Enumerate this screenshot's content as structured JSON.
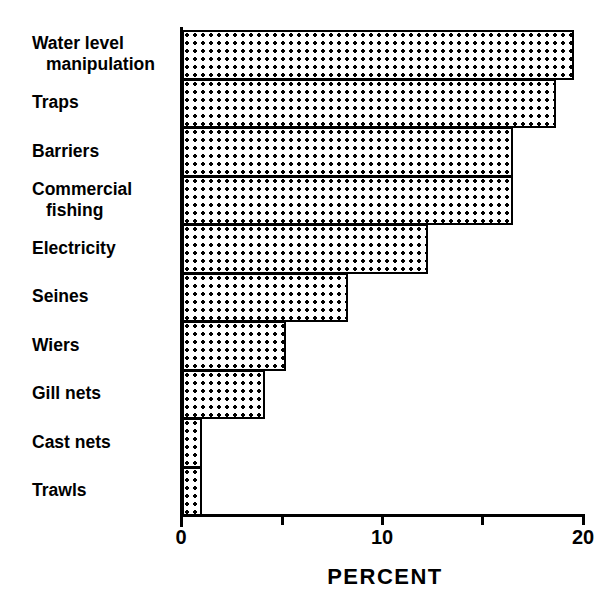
{
  "chart_data": {
    "type": "bar",
    "orientation": "horizontal",
    "title": "",
    "xlabel": "PERCENT",
    "ylabel": "",
    "xlim": [
      0,
      20
    ],
    "xticks": [
      0,
      5,
      10,
      15,
      20
    ],
    "xtick_labels": [
      "0",
      "",
      "10",
      "",
      "20"
    ],
    "grid": false,
    "legend": null,
    "categories": [
      "Water level manipulation",
      "Traps",
      "Barriers",
      "Commercial fishing",
      "Electricity",
      "Seines",
      "Wiers",
      "Gill nets",
      "Cast nets",
      "Trawls"
    ],
    "values": [
      19.3,
      18.4,
      16.3,
      16.3,
      12.1,
      8.2,
      5.1,
      4.1,
      1.0,
      1.0
    ],
    "bar_fill": "dotted-hatch",
    "bar_edge_color": "#000000",
    "bar_face_color": "#ffffff"
  },
  "labels": [
    {
      "line1": "Water level",
      "line2": "manipulation"
    },
    {
      "line1": "Traps",
      "line2": ""
    },
    {
      "line1": "Barriers",
      "line2": ""
    },
    {
      "line1": "Commercial",
      "line2": "fishing"
    },
    {
      "line1": "Electricity",
      "line2": ""
    },
    {
      "line1": "Seines",
      "line2": ""
    },
    {
      "line1": "Wiers",
      "line2": ""
    },
    {
      "line1": "Gill nets",
      "line2": ""
    },
    {
      "line1": "Cast nets",
      "line2": ""
    },
    {
      "line1": "Trawls",
      "line2": ""
    }
  ],
  "axis": {
    "title": "PERCENT",
    "tick_labels": [
      "0",
      "10",
      "20"
    ]
  }
}
